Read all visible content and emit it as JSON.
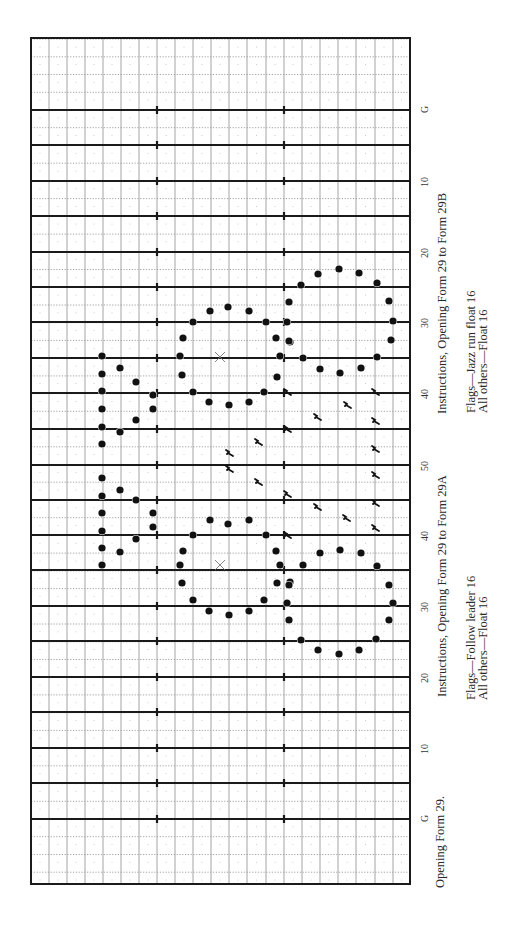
{
  "title": "Opening Form 29.",
  "field": {
    "box": {
      "left": 31,
      "top": 38,
      "right": 410,
      "bottom": 884
    },
    "columns_x": [
      31,
      49,
      67,
      85,
      103,
      121,
      139,
      157,
      175,
      193,
      211,
      229,
      247,
      266,
      284,
      302,
      320,
      338,
      356,
      375,
      393,
      410
    ],
    "hash_x": [
      157,
      284
    ],
    "yard_lines_y": [
      110,
      145,
      181,
      216,
      252,
      287,
      322,
      358,
      393,
      429,
      465,
      500,
      535,
      570,
      606,
      641,
      677,
      712,
      748,
      783,
      819
    ],
    "yard_labels": [
      {
        "text": "G",
        "y": 110
      },
      {
        "text": "10",
        "y": 181
      },
      {
        "text": "20",
        "y": 252
      },
      {
        "text": "30",
        "y": 322
      },
      {
        "text": "40",
        "y": 393
      },
      {
        "text": "50",
        "y": 465
      },
      {
        "text": "40",
        "y": 535
      },
      {
        "text": "30",
        "y": 606
      },
      {
        "text": "20",
        "y": 677
      },
      {
        "text": "10",
        "y": 748
      },
      {
        "text": "G",
        "y": 819
      }
    ],
    "colors": {
      "grid": "#9a9a9a",
      "yard_line": "#1a1a1a",
      "dot": "#111111",
      "border": "#1a1a1a"
    }
  },
  "instructions": [
    {
      "heading": "Instructions, Opening Form 29 to Form 29A",
      "lines": [
        "Flags—Follow leader 16",
        "All others—Float 16"
      ]
    },
    {
      "heading": "Instructions, Opening Form 29 to Form 29B",
      "lines": [
        "Flags—Jazz run float 16",
        "All others—Float 16"
      ]
    }
  ],
  "chart_data": {
    "type": "scatter",
    "title": "Opening Form 29.",
    "xlabel": "",
    "ylabel": "Yard line",
    "orientation": "rotated -90deg (field runs top-to-bottom)",
    "tick_labels": [
      "G",
      "10",
      "20",
      "30",
      "40",
      "50",
      "40",
      "30",
      "20",
      "10",
      "G"
    ],
    "grid": true,
    "markers": {
      "center_marks": [
        [
          220,
          357
        ],
        [
          220,
          565
        ]
      ],
      "band_dots": [
        [
          102,
          356
        ],
        [
          102,
          374
        ],
        [
          102,
          391
        ],
        [
          102,
          409
        ],
        [
          102,
          427
        ],
        [
          102,
          444
        ],
        [
          102,
          478
        ],
        [
          102,
          496
        ],
        [
          102,
          513
        ],
        [
          102,
          531
        ],
        [
          102,
          548
        ],
        [
          102,
          565
        ],
        [
          120,
          368
        ],
        [
          136,
          382
        ],
        [
          153,
          395
        ],
        [
          153,
          409
        ],
        [
          136,
          420
        ],
        [
          120,
          432
        ],
        [
          120,
          490
        ],
        [
          136,
          500
        ],
        [
          153,
          513
        ],
        [
          153,
          527
        ],
        [
          136,
          539
        ],
        [
          120,
          552
        ],
        [
          210,
          311
        ],
        [
          228,
          307
        ],
        [
          249,
          311
        ],
        [
          193,
          322
        ],
        [
          266,
          322
        ],
        [
          183,
          338
        ],
        [
          276,
          338
        ],
        [
          180,
          356
        ],
        [
          280,
          356
        ],
        [
          182,
          375
        ],
        [
          277,
          377
        ],
        [
          193,
          392
        ],
        [
          264,
          392
        ],
        [
          209,
          402
        ],
        [
          229,
          405
        ],
        [
          249,
          402
        ],
        [
          318,
          274
        ],
        [
          339,
          269
        ],
        [
          359,
          273
        ],
        [
          301,
          285
        ],
        [
          377,
          283
        ],
        [
          289,
          302
        ],
        [
          389,
          301
        ],
        [
          287,
          322
        ],
        [
          393,
          321
        ],
        [
          290,
          342
        ],
        [
          391,
          340
        ],
        [
          303,
          358
        ],
        [
          377,
          357
        ],
        [
          320,
          369
        ],
        [
          340,
          373
        ],
        [
          361,
          368
        ],
        [
          289,
          341
        ],
        [
          210,
          520
        ],
        [
          228,
          524
        ],
        [
          249,
          520
        ],
        [
          193,
          535
        ],
        [
          266,
          535
        ],
        [
          183,
          551
        ],
        [
          276,
          551
        ],
        [
          180,
          565
        ],
        [
          280,
          565
        ],
        [
          182,
          583
        ],
        [
          277,
          583
        ],
        [
          193,
          600
        ],
        [
          264,
          600
        ],
        [
          209,
          611
        ],
        [
          229,
          615
        ],
        [
          249,
          611
        ],
        [
          318,
          650
        ],
        [
          339,
          654
        ],
        [
          359,
          650
        ],
        [
          301,
          640
        ],
        [
          376,
          639
        ],
        [
          289,
          620
        ],
        [
          389,
          620
        ],
        [
          287,
          603
        ],
        [
          393,
          603
        ],
        [
          290,
          582
        ],
        [
          389,
          585
        ],
        [
          303,
          565
        ],
        [
          377,
          566
        ],
        [
          320,
          553
        ],
        [
          340,
          550
        ],
        [
          361,
          553
        ],
        [
          289,
          585
        ]
      ],
      "flags": [
        [
          287,
          392
        ],
        [
          375,
          392
        ],
        [
          347,
          405
        ],
        [
          317,
          417
        ],
        [
          375,
          421
        ],
        [
          287,
          429
        ],
        [
          258,
          442
        ],
        [
          375,
          449
        ],
        [
          229,
          453
        ],
        [
          229,
          469
        ],
        [
          375,
          475
        ],
        [
          258,
          482
        ],
        [
          287,
          494
        ],
        [
          375,
          503
        ],
        [
          317,
          507
        ],
        [
          346,
          518
        ],
        [
          375,
          528
        ],
        [
          287,
          535
        ]
      ]
    }
  }
}
